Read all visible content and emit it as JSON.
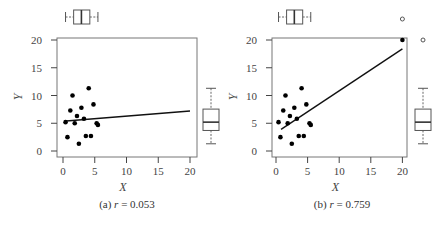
{
  "chart_data": [
    {
      "type": "scatter",
      "panel_label": "(a)",
      "caption_stat": "r = 0.053",
      "r": 0.053,
      "xlabel": "X",
      "ylabel": "Y",
      "xlim": [
        0,
        20
      ],
      "ylim": [
        0,
        20
      ],
      "xticks": [
        0,
        5,
        10,
        15,
        20
      ],
      "yticks": [
        0,
        5,
        10,
        15,
        20
      ],
      "grid": false,
      "marginal_boxplots": {
        "top": "X",
        "right": "Y"
      },
      "points": [
        {
          "x": 4.05,
          "y": 11.3
        },
        {
          "x": 1.5,
          "y": 10.0
        },
        {
          "x": 4.8,
          "y": 8.4
        },
        {
          "x": 1.15,
          "y": 7.3
        },
        {
          "x": 2.9,
          "y": 7.8
        },
        {
          "x": 2.2,
          "y": 6.3
        },
        {
          "x": 3.3,
          "y": 5.8
        },
        {
          "x": 0.4,
          "y": 5.2
        },
        {
          "x": 1.85,
          "y": 5.0
        },
        {
          "x": 5.3,
          "y": 5.0
        },
        {
          "x": 5.5,
          "y": 4.7
        },
        {
          "x": 0.7,
          "y": 2.5
        },
        {
          "x": 3.6,
          "y": 2.7
        },
        {
          "x": 4.4,
          "y": 2.7
        },
        {
          "x": 2.5,
          "y": 1.3
        }
      ],
      "fit_line": {
        "x": [
          0.5,
          20
        ],
        "y": [
          5.4,
          7.2
        ]
      }
    },
    {
      "type": "scatter",
      "panel_label": "(b)",
      "caption_stat": "r = 0.759",
      "r": 0.759,
      "xlabel": "X",
      "ylabel": "Y",
      "xlim": [
        0,
        20
      ],
      "ylim": [
        0,
        20
      ],
      "xticks": [
        0,
        5,
        10,
        15,
        20
      ],
      "yticks": [
        0,
        5,
        10,
        15,
        20
      ],
      "grid": false,
      "marginal_boxplots": {
        "top": "X",
        "right": "Y",
        "outliers": "open circles at X=20 (top) and Y=20 (right)"
      },
      "points": [
        {
          "x": 4.05,
          "y": 11.3
        },
        {
          "x": 1.5,
          "y": 10.0
        },
        {
          "x": 4.8,
          "y": 8.4
        },
        {
          "x": 1.15,
          "y": 7.3
        },
        {
          "x": 2.9,
          "y": 7.8
        },
        {
          "x": 2.2,
          "y": 6.3
        },
        {
          "x": 3.3,
          "y": 5.8
        },
        {
          "x": 0.4,
          "y": 5.2
        },
        {
          "x": 1.85,
          "y": 5.0
        },
        {
          "x": 5.3,
          "y": 5.0
        },
        {
          "x": 5.5,
          "y": 4.7
        },
        {
          "x": 0.7,
          "y": 2.5
        },
        {
          "x": 3.6,
          "y": 2.7
        },
        {
          "x": 4.4,
          "y": 2.7
        },
        {
          "x": 2.5,
          "y": 1.3
        },
        {
          "x": 20,
          "y": 20
        }
      ],
      "fit_line": {
        "x": [
          0.8,
          20
        ],
        "y": [
          3.9,
          18.4
        ]
      }
    }
  ],
  "panels": [
    {
      "label": "(a)",
      "r_sym": "r",
      "r_val": "= 0.053",
      "xlabel": "X",
      "ylabel": "Y"
    },
    {
      "label": "(b)",
      "r_sym": "r",
      "r_val": "= 0.759",
      "xlabel": "X",
      "ylabel": "Y"
    }
  ],
  "tick_labels": [
    "0",
    "5",
    "10",
    "15",
    "20"
  ]
}
